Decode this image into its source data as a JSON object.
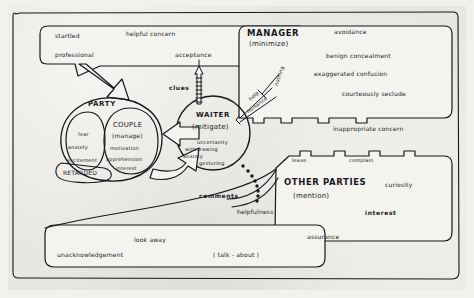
{
  "diagram": {
    "background_color": "#e9e7e2",
    "ink_color": "#17161a"
  },
  "actors": {
    "party": {
      "label": "PARTY"
    },
    "couple": {
      "label": "COUPLE",
      "parenthetical": "(manage)"
    },
    "waiter": {
      "label": "WAITER",
      "parenthetical": "(mitigate)"
    },
    "manager": {
      "label": "MANAGER",
      "parenthetical": "(minimize)"
    },
    "other_parties": {
      "label": "OTHER PARTIES",
      "parenthetical": "(mention)"
    },
    "retarded": {
      "label": "RETARDED"
    }
  },
  "party_states": [
    {
      "text": "fear"
    },
    {
      "text": "anxiety"
    },
    {
      "text": "excitement"
    }
  ],
  "couple_states": [
    {
      "text": "motivation"
    },
    {
      "text": "apprehension"
    },
    {
      "text": "interest"
    }
  ],
  "waiter_states": [
    {
      "text": "uncertainty"
    },
    {
      "text": "withdrawing"
    },
    {
      "text": "anxiety"
    },
    {
      "text": "gesturing"
    }
  ],
  "top_box": {
    "items": [
      {
        "text": "startled"
      },
      {
        "text": "helpful concern"
      },
      {
        "text": "professional"
      },
      {
        "text": "acceptance"
      }
    ]
  },
  "manager_box": {
    "items": [
      {
        "text": "avoidance"
      },
      {
        "text": "benign concealment"
      },
      {
        "text": "exaggerated confusion"
      },
      {
        "text": "courteously seclude"
      },
      {
        "text": "inappropriate concern"
      }
    ]
  },
  "other_parties_box": {
    "edge_items": [
      {
        "text": "leave"
      },
      {
        "text": "complain"
      }
    ],
    "items": [
      {
        "text": "curiosity"
      },
      {
        "text": "interest"
      },
      {
        "text": "assurance"
      }
    ]
  },
  "bottom_box": {
    "items": [
      {
        "text": "look away"
      },
      {
        "text": "unacknowledgement"
      },
      {
        "text": "( talk - about )"
      }
    ]
  },
  "connectors": {
    "clues": "clues",
    "comments": "comments",
    "helpfulness": "helpfulness",
    "help": "help",
    "nuisance": "nuisance",
    "nothing": "nothing"
  }
}
